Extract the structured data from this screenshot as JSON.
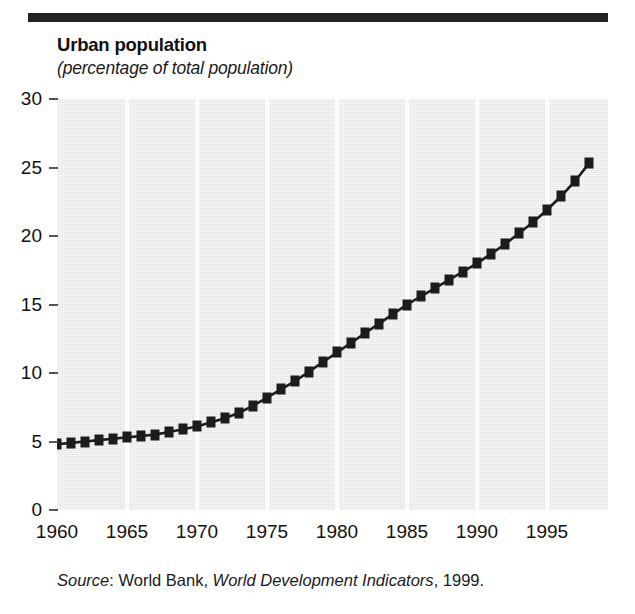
{
  "figure": {
    "title": "Urban population",
    "subtitle": "(percentage of total population)",
    "source_prefix": "Source",
    "source_colon": ": ",
    "source_publisher": "World Bank, ",
    "source_work": "World Development Indicators",
    "source_year": ", 1999.",
    "rule_color": "#222222",
    "plot_bg_color": "#e2e2e2",
    "gridline_color": "#ffffff",
    "series_color": "#1c1c1c"
  },
  "chart_data": {
    "type": "line",
    "title": "Urban population",
    "subtitle": "(percentage of total population)",
    "xlabel": "",
    "ylabel": "",
    "xlim": [
      1960,
      1999
    ],
    "ylim": [
      0,
      30
    ],
    "grid": "vertical",
    "legend": "none",
    "marker": "square",
    "x_ticks": [
      1960,
      1965,
      1970,
      1975,
      1980,
      1985,
      1990,
      1995
    ],
    "x_tick_labels": [
      "1960",
      "1965",
      "1970",
      "1975",
      "1980",
      "1985",
      "1990",
      "1995"
    ],
    "y_ticks": [
      0,
      5,
      10,
      15,
      20,
      25,
      30
    ],
    "y_tick_labels": [
      "0",
      "5",
      "10",
      "15",
      "20",
      "25",
      "30"
    ],
    "x": [
      1960,
      1961,
      1962,
      1963,
      1964,
      1965,
      1966,
      1967,
      1968,
      1969,
      1970,
      1971,
      1972,
      1973,
      1974,
      1975,
      1976,
      1977,
      1978,
      1979,
      1980,
      1981,
      1982,
      1983,
      1984,
      1985,
      1986,
      1987,
      1988,
      1989,
      1990,
      1991,
      1992,
      1993,
      1994,
      1995,
      1996,
      1997,
      1998
    ],
    "values": [
      4.8,
      4.9,
      5.0,
      5.1,
      5.2,
      5.3,
      5.4,
      5.5,
      5.7,
      5.9,
      6.1,
      6.4,
      6.7,
      7.1,
      7.6,
      8.2,
      8.8,
      9.4,
      10.1,
      10.8,
      11.5,
      12.2,
      12.9,
      13.6,
      14.3,
      15.0,
      15.6,
      16.2,
      16.8,
      17.4,
      18.0,
      18.7,
      19.4,
      20.2,
      21.0,
      21.9,
      22.9,
      24.0,
      25.3
    ],
    "series": [
      {
        "name": "Urban population",
        "values": [
          4.8,
          4.9,
          5.0,
          5.1,
          5.2,
          5.3,
          5.4,
          5.5,
          5.7,
          5.9,
          6.1,
          6.4,
          6.7,
          7.1,
          7.6,
          8.2,
          8.8,
          9.4,
          10.1,
          10.8,
          11.5,
          12.2,
          12.9,
          13.6,
          14.3,
          15.0,
          15.6,
          16.2,
          16.8,
          17.4,
          18.0,
          18.7,
          19.4,
          20.2,
          21.0,
          21.9,
          22.9,
          24.0,
          25.3
        ]
      }
    ]
  }
}
